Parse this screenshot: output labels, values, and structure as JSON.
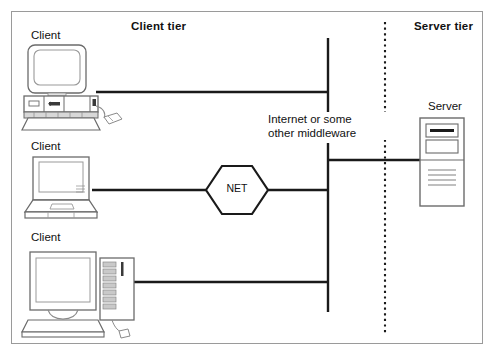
{
  "diagram": {
    "tiers": {
      "client_tier_title": "Client tier",
      "server_tier_title": "Server tier"
    },
    "clients": [
      {
        "label": "Client",
        "device": "crt-desktop-computer"
      },
      {
        "label": "Client",
        "device": "laptop-computer"
      },
      {
        "label": "Client",
        "device": "monitor-and-tower-computer"
      }
    ],
    "server": {
      "label": "Server",
      "device": "server-tower"
    },
    "network": {
      "net_node_label": "NET",
      "middleware_label_line1": "Internet or some",
      "middleware_label_line2": "other middleware"
    },
    "colors": {
      "frame_border": "#9a9a9a",
      "link_line": "#1a1a1a",
      "divider_dotted": "#1a1a1a",
      "device_outline": "#6b6b6b",
      "device_fill": "#ffffff",
      "device_shade": "#d8d8d8",
      "text": "#111111",
      "background": "#ffffff"
    }
  }
}
